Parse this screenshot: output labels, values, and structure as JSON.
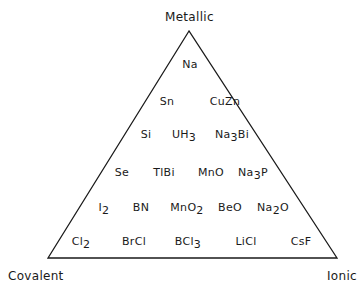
{
  "diagram": {
    "vertices": {
      "top": {
        "label": "Metallic"
      },
      "left": {
        "label": "Covalent"
      },
      "right": {
        "label": "Ionic"
      }
    },
    "line_color": "#1a1a1a",
    "rows": [
      [
        {
          "base": "Na",
          "sub": ""
        }
      ],
      [
        {
          "base": "Sn",
          "sub": ""
        },
        {
          "base": "CuZn",
          "sub": ""
        }
      ],
      [
        {
          "base": "Si",
          "sub": ""
        },
        {
          "base": "UH",
          "sub": "3"
        },
        {
          "base": "Na",
          "sub": "3",
          "tail": "Bi"
        }
      ],
      [
        {
          "base": "Se",
          "sub": ""
        },
        {
          "base": "TlBi",
          "sub": ""
        },
        {
          "base": "MnO",
          "sub": ""
        },
        {
          "base": "Na",
          "sub": "3",
          "tail": "P"
        }
      ],
      [
        {
          "base": "I",
          "sub": "2"
        },
        {
          "base": "BN",
          "sub": ""
        },
        {
          "base": "MnO",
          "sub": "2"
        },
        {
          "base": "BeO",
          "sub": ""
        },
        {
          "base": "Na",
          "sub": "2",
          "tail": "O"
        }
      ],
      [
        {
          "base": "Cl",
          "sub": "2"
        },
        {
          "base": "BrCl",
          "sub": ""
        },
        {
          "base": "BCl",
          "sub": "3"
        },
        {
          "base": "LiCl",
          "sub": ""
        },
        {
          "base": "CsF",
          "sub": ""
        }
      ]
    ]
  }
}
